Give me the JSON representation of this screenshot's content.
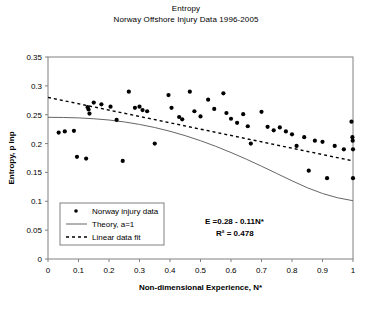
{
  "chart_data": {
    "type": "scatter",
    "title": "Entropy",
    "subtitle": "Norway Offshore Injury Data 1996-2005",
    "xlabel": "Non-dimensional Experience, N*",
    "ylabel": "Entropy, p lnp",
    "xlim": [
      0,
      1
    ],
    "ylim": [
      0,
      0.35
    ],
    "xticks": [
      "0",
      "0.1",
      "0.2",
      "0.3",
      "0.4",
      "0.5",
      "0.6",
      "0.7",
      "0.8",
      "0.9",
      "1"
    ],
    "xtick_values": [
      0,
      0.1,
      0.2,
      0.3,
      0.4,
      0.5,
      0.6,
      0.7,
      0.8,
      0.9,
      1
    ],
    "yticks": [
      "0",
      "0.05",
      "0.1",
      "0.15",
      "0.2",
      "0.25",
      "0.3",
      "0.35"
    ],
    "ytick_values": [
      0,
      0.05,
      0.1,
      0.15,
      0.2,
      0.25,
      0.3,
      0.35
    ],
    "grid": false,
    "legend_position": "inside-lower-left",
    "marker_color": "#000000",
    "line_color": "#666666",
    "fit_color": "#000000",
    "series": [
      {
        "name": "Norway injury data",
        "type": "scatter",
        "points": [
          [
            0.035,
            0.219
          ],
          [
            0.055,
            0.221
          ],
          [
            0.085,
            0.222
          ],
          [
            0.095,
            0.177
          ],
          [
            0.125,
            0.174
          ],
          [
            0.13,
            0.263
          ],
          [
            0.133,
            0.259
          ],
          [
            0.136,
            0.252
          ],
          [
            0.15,
            0.271
          ],
          [
            0.175,
            0.268
          ],
          [
            0.205,
            0.264
          ],
          [
            0.225,
            0.241
          ],
          [
            0.245,
            0.17
          ],
          [
            0.265,
            0.29
          ],
          [
            0.285,
            0.262
          ],
          [
            0.3,
            0.264
          ],
          [
            0.31,
            0.258
          ],
          [
            0.325,
            0.256
          ],
          [
            0.35,
            0.2
          ],
          [
            0.395,
            0.284
          ],
          [
            0.405,
            0.262
          ],
          [
            0.43,
            0.246
          ],
          [
            0.44,
            0.242
          ],
          [
            0.465,
            0.29
          ],
          [
            0.48,
            0.256
          ],
          [
            0.5,
            0.247
          ],
          [
            0.525,
            0.276
          ],
          [
            0.545,
            0.26
          ],
          [
            0.575,
            0.287
          ],
          [
            0.585,
            0.253
          ],
          [
            0.6,
            0.243
          ],
          [
            0.62,
            0.236
          ],
          [
            0.64,
            0.251
          ],
          [
            0.655,
            0.23
          ],
          [
            0.665,
            0.2
          ],
          [
            0.7,
            0.255
          ],
          [
            0.72,
            0.229
          ],
          [
            0.74,
            0.223
          ],
          [
            0.76,
            0.228
          ],
          [
            0.78,
            0.221
          ],
          [
            0.8,
            0.216
          ],
          [
            0.815,
            0.196
          ],
          [
            0.84,
            0.211
          ],
          [
            0.855,
            0.153
          ],
          [
            0.875,
            0.205
          ],
          [
            0.9,
            0.203
          ],
          [
            0.915,
            0.14
          ],
          [
            0.94,
            0.196
          ],
          [
            0.97,
            0.19
          ],
          [
            0.995,
            0.238
          ],
          [
            0.998,
            0.211
          ],
          [
            0.999,
            0.205
          ],
          [
            1.0,
            0.19
          ],
          [
            1.0,
            0.14
          ]
        ]
      },
      {
        "name": "Theory, a=1",
        "type": "line",
        "style": "solid",
        "points": [
          [
            0.0,
            0.2455
          ],
          [
            0.05,
            0.2452
          ],
          [
            0.1,
            0.2445
          ],
          [
            0.15,
            0.243
          ],
          [
            0.2,
            0.2408
          ],
          [
            0.25,
            0.2375
          ],
          [
            0.3,
            0.2332
          ],
          [
            0.35,
            0.2278
          ],
          [
            0.4,
            0.2213
          ],
          [
            0.45,
            0.2137
          ],
          [
            0.5,
            0.205
          ],
          [
            0.55,
            0.1952
          ],
          [
            0.6,
            0.1845
          ],
          [
            0.65,
            0.173
          ],
          [
            0.7,
            0.1608
          ],
          [
            0.75,
            0.1482
          ],
          [
            0.8,
            0.1355
          ],
          [
            0.85,
            0.1235
          ],
          [
            0.9,
            0.1135
          ],
          [
            0.95,
            0.106
          ],
          [
            1.0,
            0.101
          ]
        ]
      },
      {
        "name": "Linear data fit",
        "type": "line",
        "style": "dashed",
        "equation": "E =0.28 - 0.11N*",
        "points": [
          [
            0.0,
            0.28
          ],
          [
            1.0,
            0.17
          ]
        ]
      }
    ],
    "annotations": [
      {
        "text": "E =0.28 - 0.11N*"
      },
      {
        "text": "R² = 0.478"
      }
    ],
    "legend_entries": [
      {
        "label": "Norway injury data",
        "marker": "diamond"
      },
      {
        "label": "Theory, a=1",
        "marker": "solid-line"
      },
      {
        "label": "Linear data fit",
        "marker": "dashed-line"
      }
    ]
  }
}
